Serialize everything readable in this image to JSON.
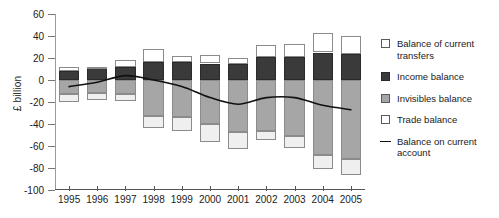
{
  "axis": {
    "ylabel": "£ billion",
    "yticks": [
      "60",
      "40",
      "20",
      "0",
      "-20",
      "-40",
      "-60",
      "-80",
      "-100"
    ],
    "xticks": [
      "1995",
      "1996",
      "1997",
      "1998",
      "1999",
      "2000",
      "2001",
      "2002",
      "2003",
      "2004",
      "2005"
    ]
  },
  "legend": {
    "items": [
      {
        "key": "transfers",
        "label": "Balance of current transfers",
        "swatch": "white-square-icon"
      },
      {
        "key": "income",
        "label": "Income balance",
        "swatch": "dark-square-icon"
      },
      {
        "key": "invisibles",
        "label": "Invisibles balance",
        "swatch": "gray-square-icon"
      },
      {
        "key": "trade",
        "label": "Trade balance",
        "swatch": "white-square-icon"
      },
      {
        "key": "line",
        "label": "Balance on current account",
        "swatch": "line-icon"
      }
    ]
  },
  "colors": {
    "transfers": "#ffffff",
    "income": "#3a3a3a",
    "invisibles": "#a6a6a6",
    "trade": "#efefef",
    "line": "#111111",
    "axis": "#555555"
  },
  "chart_data": {
    "type": "bar",
    "title": "",
    "xlabel": "",
    "ylabel": "£ billion",
    "ylim": [
      -100,
      60
    ],
    "ytick_step": 20,
    "grid": false,
    "legend_position": "right",
    "stacked": true,
    "categories": [
      "1995",
      "1996",
      "1997",
      "1998",
      "1999",
      "2000",
      "2001",
      "2002",
      "2003",
      "2004",
      "2005"
    ],
    "series": [
      {
        "name": "Balance of current transfers",
        "values": [
          4,
          1,
          6,
          12,
          6,
          8,
          5,
          11,
          12,
          18,
          16
        ]
      },
      {
        "name": "Income balance",
        "values": [
          8,
          11,
          12,
          16,
          16,
          15,
          15,
          21,
          21,
          25,
          24
        ]
      },
      {
        "name": "Invisibles balance",
        "values": [
          -13,
          -12,
          -13,
          -33,
          -34,
          -40,
          -47,
          -46,
          -51,
          -68,
          -72
        ]
      },
      {
        "name": "Trade balance",
        "values": [
          -7,
          -6,
          -6,
          -11,
          -12,
          -16,
          -16,
          -9,
          -11,
          -13,
          -14
        ]
      },
      {
        "name": "Balance on current account",
        "values": [
          -6,
          -2,
          4,
          0,
          -6,
          -16,
          -22,
          -16,
          -16,
          -23,
          -27
        ],
        "render": "line"
      }
    ]
  }
}
